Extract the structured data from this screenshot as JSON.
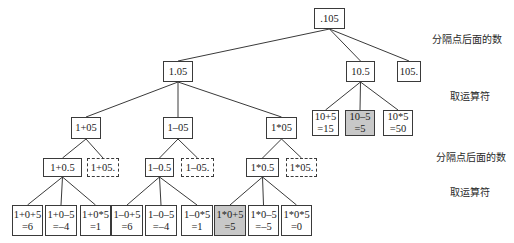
{
  "diagram": {
    "type": "tree",
    "nodes": [
      {
        "id": "root",
        "text": ".105",
        "x": 314,
        "y": 8,
        "w": 31,
        "h": 21,
        "style": "solid"
      },
      {
        "id": "n105a",
        "text": "1.05",
        "x": 163,
        "y": 61,
        "w": 30,
        "h": 21,
        "style": "solid"
      },
      {
        "id": "n105b",
        "text": "10.5",
        "x": 346,
        "y": 61,
        "w": 29,
        "h": 21,
        "style": "solid"
      },
      {
        "id": "n105c",
        "text": "105.",
        "x": 397,
        "y": 61,
        "w": 24,
        "h": 21,
        "style": "solid"
      },
      {
        "id": "a_plus",
        "text": "1+05",
        "x": 71,
        "y": 117,
        "w": 30,
        "h": 22,
        "style": "solid"
      },
      {
        "id": "a_minus",
        "text": "1–05",
        "x": 163,
        "y": 117,
        "w": 30,
        "h": 22,
        "style": "solid"
      },
      {
        "id": "a_mul",
        "text": "1*05",
        "x": 266,
        "y": 117,
        "w": 31,
        "h": 22,
        "style": "solid"
      },
      {
        "id": "b_plus",
        "line1": "10+5",
        "line2": "=15",
        "x": 312,
        "y": 110,
        "w": 27,
        "h": 26,
        "style": "solid"
      },
      {
        "id": "b_minus",
        "line1": "10–5",
        "line2": "=5",
        "x": 345,
        "y": 110,
        "w": 30,
        "h": 26,
        "style": "shaded"
      },
      {
        "id": "b_mul",
        "line1": "10*5",
        "line2": "=50",
        "x": 383,
        "y": 110,
        "w": 30,
        "h": 26,
        "style": "solid"
      },
      {
        "id": "p_sep",
        "text": "1+0.5",
        "x": 43,
        "y": 158,
        "w": 39,
        "h": 19,
        "style": "solid"
      },
      {
        "id": "p_end",
        "text": "1+05.",
        "x": 87,
        "y": 158,
        "w": 32,
        "h": 19,
        "style": "dashed"
      },
      {
        "id": "m_sep",
        "text": "1–0.5",
        "x": 145,
        "y": 158,
        "w": 29,
        "h": 19,
        "style": "solid"
      },
      {
        "id": "m_end",
        "text": "1–05.",
        "x": 181,
        "y": 158,
        "w": 33,
        "h": 19,
        "style": "dashed"
      },
      {
        "id": "x_sep",
        "text": "1*0.5",
        "x": 246,
        "y": 158,
        "w": 33,
        "h": 19,
        "style": "solid"
      },
      {
        "id": "x_end",
        "text": "1*05.",
        "x": 286,
        "y": 158,
        "w": 31,
        "h": 19,
        "style": "dashed"
      },
      {
        "id": "l1",
        "line1": "1+0+5",
        "line2": "=6",
        "x": 12,
        "y": 205,
        "w": 31,
        "h": 31,
        "style": "solid"
      },
      {
        "id": "l2",
        "line1": "1+0–5",
        "line2": "=–4",
        "x": 45,
        "y": 205,
        "w": 32,
        "h": 31,
        "style": "solid"
      },
      {
        "id": "l3",
        "line1": "1+0*5",
        "line2": "=1",
        "x": 80,
        "y": 205,
        "w": 31,
        "h": 31,
        "style": "solid"
      },
      {
        "id": "l4",
        "line1": "1–0+5",
        "line2": "=6",
        "x": 111,
        "y": 205,
        "w": 32,
        "h": 31,
        "style": "solid"
      },
      {
        "id": "l5",
        "line1": "1–0–5",
        "line2": "=–4",
        "x": 145,
        "y": 205,
        "w": 32,
        "h": 31,
        "style": "solid"
      },
      {
        "id": "l6",
        "line1": "1–0*5",
        "line2": "=1",
        "x": 181,
        "y": 205,
        "w": 32,
        "h": 31,
        "style": "solid"
      },
      {
        "id": "l7",
        "line1": "1*0+5",
        "line2": "=5",
        "x": 214,
        "y": 205,
        "w": 32,
        "h": 31,
        "style": "shaded"
      },
      {
        "id": "l8",
        "line1": "1*0–5",
        "line2": "=–5",
        "x": 248,
        "y": 205,
        "w": 31,
        "h": 31,
        "style": "solid"
      },
      {
        "id": "l9",
        "line1": "1*0*5",
        "line2": "=0",
        "x": 281,
        "y": 205,
        "w": 31,
        "h": 31,
        "style": "solid"
      }
    ],
    "edges": [
      [
        "root",
        "n105a"
      ],
      [
        "root",
        "n105b"
      ],
      [
        "root",
        "n105c"
      ],
      [
        "n105a",
        "a_plus"
      ],
      [
        "n105a",
        "a_minus"
      ],
      [
        "n105a",
        "a_mul"
      ],
      [
        "n105b",
        "b_plus"
      ],
      [
        "n105b",
        "b_minus"
      ],
      [
        "n105b",
        "b_mul"
      ],
      [
        "a_plus",
        "p_sep"
      ],
      [
        "a_plus",
        "p_end"
      ],
      [
        "a_minus",
        "m_sep"
      ],
      [
        "a_minus",
        "m_end"
      ],
      [
        "a_mul",
        "x_sep"
      ],
      [
        "a_mul",
        "x_end"
      ],
      [
        "p_sep",
        "l1"
      ],
      [
        "p_sep",
        "l2"
      ],
      [
        "p_sep",
        "l3"
      ],
      [
        "m_sep",
        "l4"
      ],
      [
        "m_sep",
        "l5"
      ],
      [
        "m_sep",
        "l6"
      ],
      [
        "x_sep",
        "l7"
      ],
      [
        "x_sep",
        "l8"
      ],
      [
        "x_sep",
        "l9"
      ]
    ],
    "colors": {
      "line": "#3a3a3a",
      "shaded_fill": "#c8c8c8",
      "background": "#ffffff"
    }
  },
  "labels": [
    {
      "text": "分隔点后面的数",
      "x": 432,
      "y": 31
    },
    {
      "text": "取运算符",
      "x": 450,
      "y": 88
    },
    {
      "text": "分隔点后面的数",
      "x": 436,
      "y": 149
    },
    {
      "text": "取运算符",
      "x": 450,
      "y": 184
    }
  ]
}
